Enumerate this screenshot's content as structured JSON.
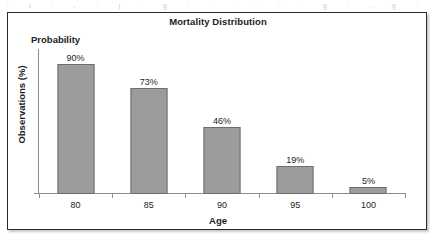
{
  "scan": {
    "artifact_text": "· ı · , · ȷ · ɡ · · · · · · ɡ · , ɡ · , ɡ ·"
  },
  "figure": {
    "title": "Mortality Distribution",
    "series_label": "Probability",
    "frame_color": "#2b2b2b",
    "bar_fill": "#9c9c9c",
    "bar_stroke": "#6e6e6e",
    "axis_color": "#8e8e8e"
  },
  "chart_data": {
    "type": "bar",
    "title": "Mortality Distribution",
    "subtitle": "Probability",
    "xlabel": "Age",
    "ylabel": "Observations (%)",
    "categories": [
      "80",
      "85",
      "90",
      "95",
      "100"
    ],
    "values": [
      90,
      73,
      46,
      19,
      5
    ],
    "value_labels": [
      "90%",
      "73%",
      "46%",
      "19%",
      "5%"
    ],
    "series": [
      {
        "name": "Probability",
        "values": [
          90,
          73,
          46,
          19,
          5
        ]
      }
    ],
    "ylim": [
      0,
      100
    ],
    "y_tick_labels": [],
    "grid": false,
    "legend": "none",
    "legend_position": "top-left",
    "bar_color": "#9c9c9c"
  }
}
